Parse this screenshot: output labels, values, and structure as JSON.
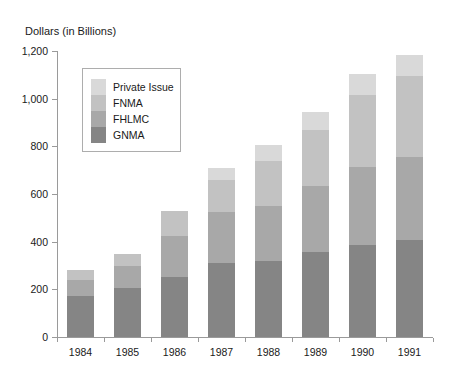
{
  "title": "Dollars (in Billions)",
  "chart_data": {
    "type": "bar",
    "stacked": true,
    "title": "Dollars (in Billions)",
    "xlabel": "",
    "ylabel": "Dollars (in Billions)",
    "categories": [
      "1984",
      "1985",
      "1986",
      "1987",
      "1988",
      "1989",
      "1990",
      "1991"
    ],
    "series": [
      {
        "name": "GNMA",
        "color": "#858585",
        "values": [
          170,
          205,
          250,
          310,
          320,
          355,
          385,
          405
        ]
      },
      {
        "name": "FHLMC",
        "color": "#a8a8a8",
        "values": [
          70,
          95,
          175,
          215,
          230,
          280,
          330,
          350
        ]
      },
      {
        "name": "FNMA",
        "color": "#c2c2c2",
        "values": [
          40,
          50,
          105,
          135,
          190,
          235,
          300,
          340
        ]
      },
      {
        "name": "Private Issue",
        "color": "#d9d9d9",
        "values": [
          0,
          0,
          0,
          50,
          65,
          75,
          90,
          90
        ]
      }
    ],
    "stack_order_bottom_to_top": [
      "GNMA",
      "FHLMC",
      "FNMA",
      "Private Issue"
    ],
    "totals": [
      280,
      350,
      530,
      710,
      805,
      945,
      1105,
      1185
    ],
    "ylim": [
      0,
      1200
    ],
    "yticks": [
      0,
      200,
      400,
      600,
      800,
      1000,
      1200
    ],
    "ytick_labels": [
      "0",
      "200",
      "400",
      "600",
      "800",
      "1,000",
      "1,200"
    ],
    "grid": false,
    "legend": {
      "position": "upper-left",
      "entries_top_to_bottom": [
        "Private Issue",
        "FNMA",
        "FHLMC",
        "GNMA"
      ]
    },
    "axis_color": "#9a9a9a",
    "text_color": "#1a1a1a"
  }
}
